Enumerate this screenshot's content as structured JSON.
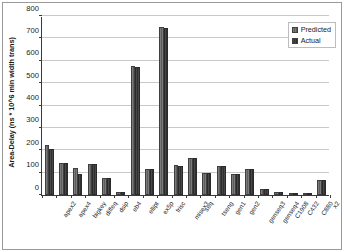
{
  "chart_data": {
    "type": "bar",
    "title": "",
    "xlabel": "",
    "ylabel": "Area-Delay (ns * 10^6 min width trans)",
    "ylim": [
      0,
      800
    ],
    "ytick_values": [
      0,
      100,
      200,
      300,
      400,
      500,
      600,
      700,
      800
    ],
    "ytick_labels": [
      "0",
      "100",
      "200",
      "300",
      "400",
      "500",
      "600",
      "700",
      "800"
    ],
    "grid": true,
    "grid_axis": "y",
    "legend_position": "top-right",
    "categories": [
      "apex2",
      "apex4",
      "bigkey",
      "diffeq",
      "dsip",
      "eb4",
      "ellipt",
      "ex5p",
      "frisc",
      "misex3",
      "seq",
      "tseng",
      "gen1",
      "gen2",
      "genseq3",
      "genseq4",
      "C1908",
      "C432",
      "C880",
      "x2"
    ],
    "series": [
      {
        "name": "Predicted",
        "color": "#6e6e6e",
        "values": [
          223,
          145,
          120,
          138,
          78,
          13,
          575,
          117,
          750,
          133,
          165,
          100,
          130,
          95,
          117,
          28,
          13,
          9,
          10,
          65
        ]
      },
      {
        "name": "Actual",
        "color": "#3a3a3a",
        "values": [
          205,
          145,
          95,
          138,
          78,
          13,
          573,
          115,
          747,
          128,
          165,
          99,
          130,
          92,
          115,
          28,
          13,
          9,
          10,
          65
        ]
      }
    ]
  },
  "legend": {
    "entries": [
      {
        "label": "Predicted"
      },
      {
        "label": "Actual"
      }
    ]
  }
}
